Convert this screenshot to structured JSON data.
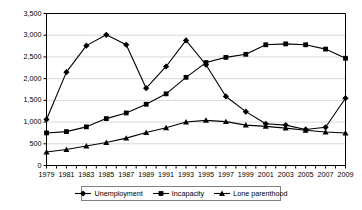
{
  "chart_data": {
    "type": "line",
    "title": "",
    "subtitle": "",
    "xlabel": "",
    "ylabel": "",
    "xlim": [
      1979,
      2009
    ],
    "ylim": [
      0,
      3500
    ],
    "grid": "horizontal",
    "legend_position": "bottom",
    "x": [
      1979,
      1981,
      1983,
      1985,
      1987,
      1989,
      1991,
      1993,
      1995,
      1997,
      1999,
      2001,
      2003,
      2005,
      2007,
      2009
    ],
    "xtick_labels": [
      "1979",
      "1981",
      "1983",
      "1985",
      "1987",
      "1989",
      "1991",
      "1993",
      "1995",
      "1997",
      "1999",
      "2001",
      "2003",
      "2005",
      "2007",
      "2009"
    ],
    "ytick_values": [
      0,
      500,
      1000,
      1500,
      2000,
      2500,
      3000,
      3500
    ],
    "ytick_labels": [
      "0",
      "500",
      "1,000",
      "1,500",
      "2,000",
      "2,500",
      "3,000",
      "3,500"
    ],
    "series": [
      {
        "name": "Unemployment",
        "marker": "diamond",
        "color": "#000000",
        "values": [
          1060,
          2150,
          2760,
          3010,
          2780,
          1780,
          2280,
          2880,
          2320,
          1590,
          1240,
          960,
          930,
          830,
          880,
          1550
        ]
      },
      {
        "name": "Incapacity",
        "marker": "square",
        "color": "#000000",
        "values": [
          750,
          780,
          890,
          1080,
          1210,
          1410,
          1650,
          2030,
          2370,
          2490,
          2560,
          2780,
          2800,
          2780,
          2680,
          2470
        ]
      },
      {
        "name": "Lone parenthood",
        "marker": "triangle",
        "color": "#000000",
        "values": [
          310,
          370,
          450,
          530,
          630,
          760,
          870,
          1000,
          1040,
          1010,
          930,
          900,
          860,
          810,
          770,
          750
        ]
      }
    ]
  },
  "legend": {
    "items": [
      {
        "label": "Unemployment",
        "marker": "diamond"
      },
      {
        "label": "Incapacity",
        "marker": "square"
      },
      {
        "label": "Lone parenthood",
        "marker": "triangle"
      }
    ]
  },
  "colors": {
    "axis": "#000000",
    "grid": "#d9d9d9",
    "series": "#000000",
    "legend_border": "#808080"
  }
}
